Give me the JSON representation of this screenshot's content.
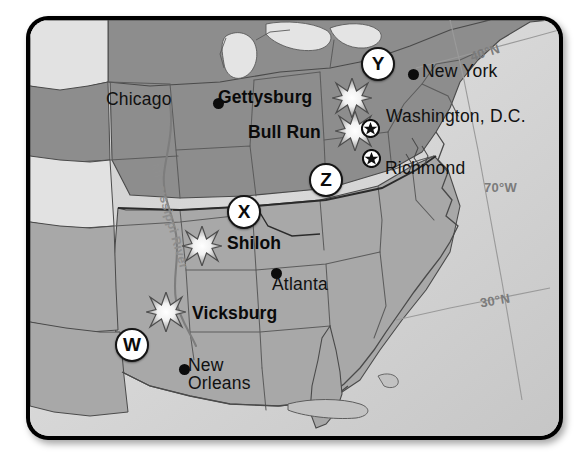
{
  "map": {
    "title": "American Civil War Map",
    "colors": {
      "union": "#8d8d8d",
      "confederate": "#a8a8a8",
      "territory": "#e2e2e2",
      "ocean": "#d4d4d4",
      "border": "#1a1a1a",
      "grid_label": "#7b7b7b",
      "label_text": "#111111"
    },
    "river": {
      "name": "Mississippi River"
    },
    "grid_labels": [
      {
        "text": "40°N",
        "x": 466,
        "y": 42
      },
      {
        "text": "70°W",
        "x": 480,
        "y": 177
      },
      {
        "text": "30°N",
        "x": 476,
        "y": 290
      }
    ],
    "cities": [
      {
        "name": "Chicago",
        "dot_x": 189,
        "dot_y": 100,
        "label_x": 108,
        "label_y": 92,
        "lines": 1
      },
      {
        "name": "New York",
        "dot_x": 410,
        "dot_y": 71,
        "label_x": 421,
        "label_y": 64,
        "lines": 1
      },
      {
        "name": "Washington, D.C.",
        "dot_x": null,
        "dot_y": null,
        "label_x": 385,
        "label_y": 109,
        "lines": 1
      },
      {
        "name": "Richmond",
        "dot_x": null,
        "dot_y": null,
        "label_x": 384,
        "label_y": 161,
        "lines": 1
      },
      {
        "name": "Atlanta",
        "dot_x": 272,
        "dot_y": 270,
        "label_x": 273,
        "label_y": 276,
        "lines": 1
      },
      {
        "name": "New Orleans",
        "dot_x": 180,
        "dot_y": 366,
        "label_x": 189,
        "label_y": 359,
        "lines": 2
      }
    ],
    "battles": [
      {
        "name": "Gettysburg",
        "star_x": 352,
        "star_y": 100,
        "label_x": 219,
        "label_y": 90
      },
      {
        "name": "Bull Run",
        "star_x": 355,
        "star_y": 133,
        "label_x": 249,
        "label_y": 125
      },
      {
        "name": "Shiloh",
        "star_x": 202,
        "star_y": 248,
        "label_x": 228,
        "label_y": 236
      },
      {
        "name": "Vicksburg",
        "star_x": 166,
        "star_y": 314,
        "label_x": 193,
        "label_y": 306
      }
    ],
    "capitals": [
      {
        "name": "Washington, D.C.",
        "x": 370,
        "y": 128
      },
      {
        "name": "Richmond",
        "x": 371,
        "y": 158
      }
    ],
    "quiz_markers": [
      {
        "letter": "W",
        "x": 126,
        "y": 338
      },
      {
        "letter": "X",
        "x": 238,
        "y": 205
      },
      {
        "letter": "Y",
        "x": 372,
        "y": 57
      },
      {
        "letter": "Z",
        "x": 320,
        "y": 173
      }
    ]
  }
}
